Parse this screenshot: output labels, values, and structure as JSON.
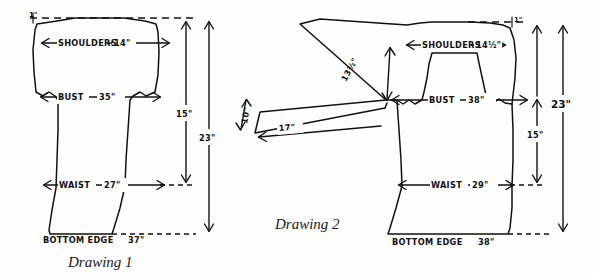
{
  "page": {
    "background_color": "#fefefe",
    "ink_color": "#111111"
  },
  "drawings": [
    {
      "id": "drawing-1",
      "caption": "Drawing 1",
      "type": "set-in sleeve body schematic",
      "measurements": {
        "top_edge_note": "1\"",
        "shoulders_label": "SHOULDERS",
        "shoulders_value": "14\"",
        "bust_label": "BUST",
        "bust_value": "35\"",
        "waist_label": "WAIST",
        "waist_value": "27\"",
        "bottom_edge_label": "BOTTOM EDGE",
        "bottom_edge_value": "37\"",
        "height_inner": "15\"",
        "height_outer": "23\""
      }
    },
    {
      "id": "drawing-2",
      "caption": "Drawing 2",
      "type": "drop shoulder / sleeve extension schematic",
      "measurements": {
        "top_edge_note": "1\"",
        "shoulders_label": "SHOULDERS",
        "shoulders_value": "14½\"",
        "bust_label": "BUST",
        "bust_value": "38\"",
        "waist_label": "WAIST",
        "waist_value": "29\"",
        "bottom_edge_label": "BOTTOM EDGE",
        "bottom_edge_value": "38\"",
        "height_inner": "15\"",
        "height_outer": "23\"",
        "sleeve_length": "17\"",
        "sleeve_cuff": "10\"",
        "armhole_depth": "13½\""
      }
    }
  ]
}
